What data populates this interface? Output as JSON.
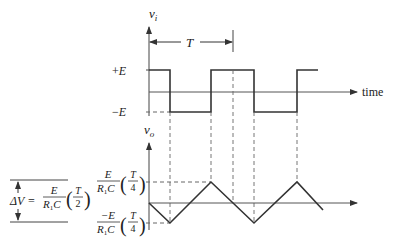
{
  "diagram": {
    "type": "waveform-timing",
    "input_panel": {
      "axis_label": "v",
      "axis_label_sub": "i",
      "level_high_label": "+E",
      "level_low_label": "−E",
      "period_label": "T",
      "time_label": "time",
      "waveform": "square"
    },
    "output_panel": {
      "axis_label": "v",
      "axis_label_sub": "o",
      "waveform": "triangle",
      "upper_level": {
        "num": "E",
        "den_R": "R",
        "den_sub": "1",
        "den_C": "C",
        "paren_num": "T",
        "paren_den": "4"
      },
      "lower_level": {
        "num": "−E",
        "den_R": "R",
        "den_sub": "1",
        "den_C": "C",
        "paren_num": "T",
        "paren_den": "4"
      }
    },
    "delta_v": {
      "lhs": "ΔV =",
      "num": "E",
      "den_R": "R",
      "den_sub": "1",
      "den_C": "C",
      "paren_num": "T",
      "paren_den": "2"
    },
    "colors": {
      "line": "#333333",
      "thin": "#555555",
      "dashed": "#666666"
    }
  }
}
